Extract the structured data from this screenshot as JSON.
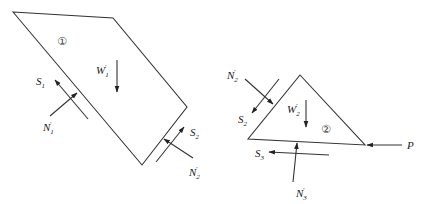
{
  "diagram": {
    "type": "free-body diagram",
    "bodies": [
      {
        "id": "body-1",
        "marker": "①",
        "shape": "quadrilateral",
        "points": [
          [
            13,
            12
          ],
          [
            113,
            18
          ],
          [
            187,
            107
          ],
          [
            142,
            165
          ]
        ]
      },
      {
        "id": "body-2",
        "marker": "②",
        "shape": "triangle",
        "points": [
          [
            300,
            75
          ],
          [
            365,
            145
          ],
          [
            248,
            139
          ]
        ]
      }
    ],
    "labels": {
      "S1": {
        "base": "S",
        "sub": "1",
        "prime": ""
      },
      "N1p": {
        "base": "N",
        "sub": "1",
        "prime": "′"
      },
      "W1p": {
        "base": "W",
        "sub": "1",
        "prime": "′"
      },
      "S2a": {
        "base": "S",
        "sub": "2",
        "prime": ""
      },
      "N2pa": {
        "base": "N",
        "sub": "2",
        "prime": "′"
      },
      "N2pb": {
        "base": "N",
        "sub": "2",
        "prime": "′"
      },
      "S2b": {
        "base": "S",
        "sub": "2",
        "prime": ""
      },
      "W2p": {
        "base": "W",
        "sub": "2",
        "prime": "′"
      },
      "S3": {
        "base": "S",
        "sub": "3",
        "prime": ""
      },
      "N3p": {
        "base": "N",
        "sub": "3",
        "prime": "′"
      },
      "P": {
        "base": "P",
        "sub": "",
        "prime": ""
      }
    },
    "markers": {
      "body1": "①",
      "body2": "②"
    }
  }
}
